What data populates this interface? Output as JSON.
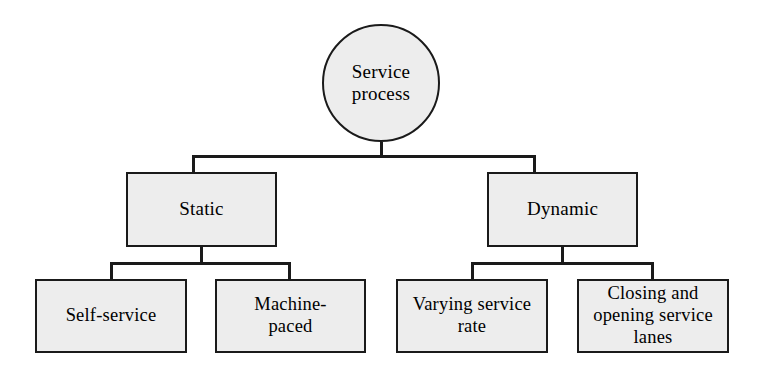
{
  "diagram": {
    "type": "hierarchy-tree",
    "orientation": "top-down",
    "levels": 3,
    "style": {
      "node_fill": "#ededed",
      "node_border": "#1a1a1a",
      "connector_color": "#1a1a1a",
      "background": "#ffffff"
    },
    "root": {
      "id": "root",
      "shape": "circle",
      "label": "Service\nprocess"
    },
    "level2": [
      {
        "id": "static",
        "shape": "rectangle",
        "label": "Static"
      },
      {
        "id": "dynamic",
        "shape": "rectangle",
        "label": "Dynamic"
      }
    ],
    "level3": [
      {
        "id": "self-service",
        "parent": "static",
        "shape": "rectangle",
        "label": "Self-service"
      },
      {
        "id": "machine-paced",
        "parent": "static",
        "shape": "rectangle",
        "label": "Machine-\npaced"
      },
      {
        "id": "varying-service-rate",
        "parent": "dynamic",
        "shape": "rectangle",
        "label": "Varying service\nrate"
      },
      {
        "id": "closing-opening-lanes",
        "parent": "dynamic",
        "shape": "rectangle",
        "label": "Closing and\nopening service\nlanes"
      }
    ]
  }
}
